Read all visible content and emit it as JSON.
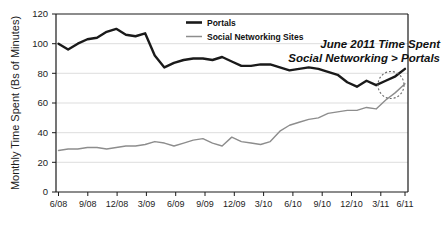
{
  "chart_data": {
    "type": "line",
    "title": "",
    "xlabel": "",
    "ylabel": "Monthly Time Spent (Bs of Minutes)",
    "ylim": [
      0,
      120
    ],
    "yticks": [
      0,
      20,
      40,
      60,
      80,
      100,
      120
    ],
    "grid": true,
    "legend_position": "top-center",
    "x": [
      "6/08",
      "7/08",
      "8/08",
      "9/08",
      "10/08",
      "11/08",
      "12/08",
      "1/09",
      "2/09",
      "3/09",
      "4/09",
      "5/09",
      "6/09",
      "7/09",
      "8/09",
      "9/09",
      "10/09",
      "11/09",
      "12/09",
      "1/10",
      "2/10",
      "3/10",
      "4/10",
      "5/10",
      "6/10",
      "7/10",
      "8/10",
      "9/10",
      "10/10",
      "11/10",
      "12/10",
      "1/11",
      "2/11",
      "3/11",
      "4/11",
      "5/11",
      "6/11"
    ],
    "xtick_labels": [
      "6/08",
      "9/08",
      "12/08",
      "3/09",
      "6/09",
      "9/09",
      "12/09",
      "3/10",
      "6/10",
      "9/10",
      "12/10",
      "3/11",
      "6/11"
    ],
    "series": [
      {
        "name": "Portals",
        "color": "#1a1a1a",
        "values": [
          100,
          96,
          100,
          103,
          104,
          108,
          110,
          106,
          105,
          107,
          92,
          84,
          87,
          89,
          90,
          90,
          89,
          91,
          88,
          85,
          85,
          86,
          86,
          84,
          82,
          83,
          84,
          83,
          81,
          79,
          74,
          71,
          75,
          72,
          75,
          78,
          83
        ]
      },
      {
        "name": "Social Networking Sites",
        "color": "#8d8d8d",
        "values": [
          28,
          29,
          29,
          30,
          30,
          29,
          30,
          31,
          31,
          32,
          34,
          33,
          31,
          33,
          35,
          36,
          33,
          31,
          37,
          34,
          33,
          32,
          34,
          41,
          45,
          47,
          49,
          50,
          53,
          54,
          55,
          55,
          57,
          56,
          62,
          67,
          73
        ]
      }
    ],
    "annotations": [
      {
        "name": "crossover-callout",
        "line1": "June 2011 Time Spent",
        "line2": "Social Networking > Portals",
        "highlight": "dashed-ellipse-at-crossover"
      }
    ]
  },
  "legend": {
    "items": [
      {
        "label": "Portals",
        "swatch": "thick-black-line"
      },
      {
        "label": "Social Networking Sites",
        "swatch": "thin-gray-line"
      }
    ]
  },
  "colors": {
    "portals": "#1a1a1a",
    "social": "#8d8d8d",
    "grid": "#d9d9d9",
    "axis": "#1a1a1a",
    "background": "#ffffff"
  }
}
